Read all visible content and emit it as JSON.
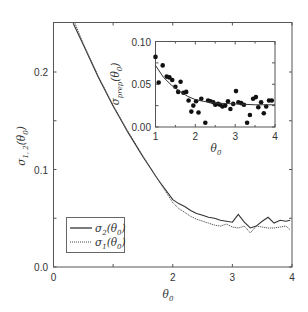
{
  "chart_data": [
    {
      "type": "line",
      "title": "",
      "xlabel": "θ0",
      "ylabel": "σ1,2(θ0)",
      "xlim": [
        0,
        4
      ],
      "ylim": [
        0.0,
        0.25
      ],
      "xticks": [
        "0",
        "2",
        "3",
        "4"
      ],
      "yticks": [
        "0.0",
        "0.1",
        "0.2"
      ],
      "grid": false,
      "legend_position": "lower left",
      "legend": [
        "σ2(θ0)",
        "σ1(θ0)"
      ],
      "series": [
        {
          "name": "σ2(θ0)",
          "style": "solid",
          "x": [
            0.33,
            0.5,
            0.75,
            1.0,
            1.25,
            1.5,
            1.75,
            2.0,
            2.1,
            2.2,
            2.3,
            2.4,
            2.5,
            2.6,
            2.7,
            2.8,
            2.9,
            3.0,
            3.1,
            3.2,
            3.3,
            3.4,
            3.5,
            3.6,
            3.7,
            3.8,
            3.9,
            3.97
          ],
          "values": [
            0.25,
            0.228,
            0.195,
            0.165,
            0.138,
            0.113,
            0.09,
            0.069,
            0.065,
            0.062,
            0.058,
            0.055,
            0.053,
            0.051,
            0.05,
            0.048,
            0.047,
            0.046,
            0.054,
            0.046,
            0.04,
            0.042,
            0.047,
            0.051,
            0.045,
            0.048,
            0.047,
            0.048
          ]
        },
        {
          "name": "σ1(θ0)",
          "style": "dotted",
          "x": [
            0.36,
            0.5,
            0.75,
            1.0,
            1.25,
            1.5,
            1.75,
            2.0,
            2.1,
            2.2,
            2.3,
            2.4,
            2.5,
            2.6,
            2.7,
            2.8,
            2.9,
            3.0,
            3.1,
            3.2,
            3.3,
            3.4,
            3.5,
            3.6,
            3.7,
            3.8,
            3.9,
            3.97
          ],
          "values": [
            0.25,
            0.229,
            0.196,
            0.166,
            0.139,
            0.114,
            0.09,
            0.066,
            0.06,
            0.056,
            0.052,
            0.049,
            0.047,
            0.045,
            0.043,
            0.042,
            0.044,
            0.041,
            0.04,
            0.042,
            0.035,
            0.042,
            0.041,
            0.04,
            0.04,
            0.041,
            0.042,
            0.038
          ]
        }
      ]
    },
    {
      "type": "scatter",
      "title": "inset",
      "xlabel": "θ0",
      "ylabel": "σprep(θ0)",
      "xlim": [
        1,
        4
      ],
      "ylim": [
        0.0,
        0.1
      ],
      "xticks": [
        "1",
        "2",
        "3",
        "4"
      ],
      "yticks": [
        "0.00",
        "0.05",
        "0.10"
      ],
      "grid": false,
      "series": [
        {
          "name": "σprep data",
          "style": "markers",
          "x": [
            1.0,
            1.08,
            1.18,
            1.28,
            1.35,
            1.42,
            1.5,
            1.57,
            1.63,
            1.7,
            1.77,
            1.83,
            1.9,
            1.95,
            2.02,
            2.08,
            2.15,
            2.25,
            2.32,
            2.38,
            2.45,
            2.5,
            2.57,
            2.62,
            2.68,
            2.75,
            2.82,
            2.88,
            2.95,
            3.02,
            3.08,
            3.15,
            3.22,
            3.3,
            3.37,
            3.45,
            3.52,
            3.58,
            3.65,
            3.72,
            3.78,
            3.85,
            3.92
          ],
          "values": [
            0.082,
            0.052,
            0.072,
            0.059,
            0.058,
            0.055,
            0.047,
            0.041,
            0.053,
            0.04,
            0.041,
            0.031,
            0.018,
            0.025,
            0.03,
            0.017,
            0.033,
            0.005,
            0.031,
            0.03,
            0.029,
            0.026,
            0.027,
            0.026,
            0.024,
            0.025,
            0.03,
            0.021,
            0.027,
            0.042,
            0.029,
            0.028,
            0.026,
            0.005,
            0.014,
            0.033,
            0.035,
            0.023,
            0.029,
            0.016,
            0.024,
            0.031,
            0.031
          ]
        },
        {
          "name": "fit",
          "style": "solid",
          "x": [
            1.0,
            1.2,
            1.4,
            1.6,
            1.8,
            2.0,
            2.2,
            2.5,
            3.0,
            3.5,
            4.0
          ],
          "values": [
            0.072,
            0.058,
            0.049,
            0.042,
            0.036,
            0.032,
            0.03,
            0.028,
            0.027,
            0.026,
            0.026
          ]
        }
      ]
    }
  ],
  "labels": {
    "main_ylabel_base": "σ",
    "main_ylabel_sub": "1, 2",
    "main_ylabel_arg": "(θ",
    "main_ylabel_arg_sub": "0",
    "main_ylabel_close": ")",
    "main_xlabel_base": "θ",
    "main_xlabel_sub": "0",
    "inset_ylabel_base": "σ",
    "inset_ylabel_sub": "prep",
    "inset_ylabel_arg": "(θ",
    "inset_ylabel_arg_sub": "0",
    "inset_ylabel_close": ")",
    "inset_xlabel_base": "θ",
    "inset_xlabel_sub": "0",
    "legend_s2_base": "σ",
    "legend_s2_sub": "2",
    "legend_s1_base": "σ",
    "legend_s1_sub": "1",
    "legend_arg": "(θ",
    "legend_arg_sub": "0",
    "legend_close": ")"
  },
  "colors": {
    "axis": "#555555",
    "line": "#333333",
    "text": "#333333"
  }
}
